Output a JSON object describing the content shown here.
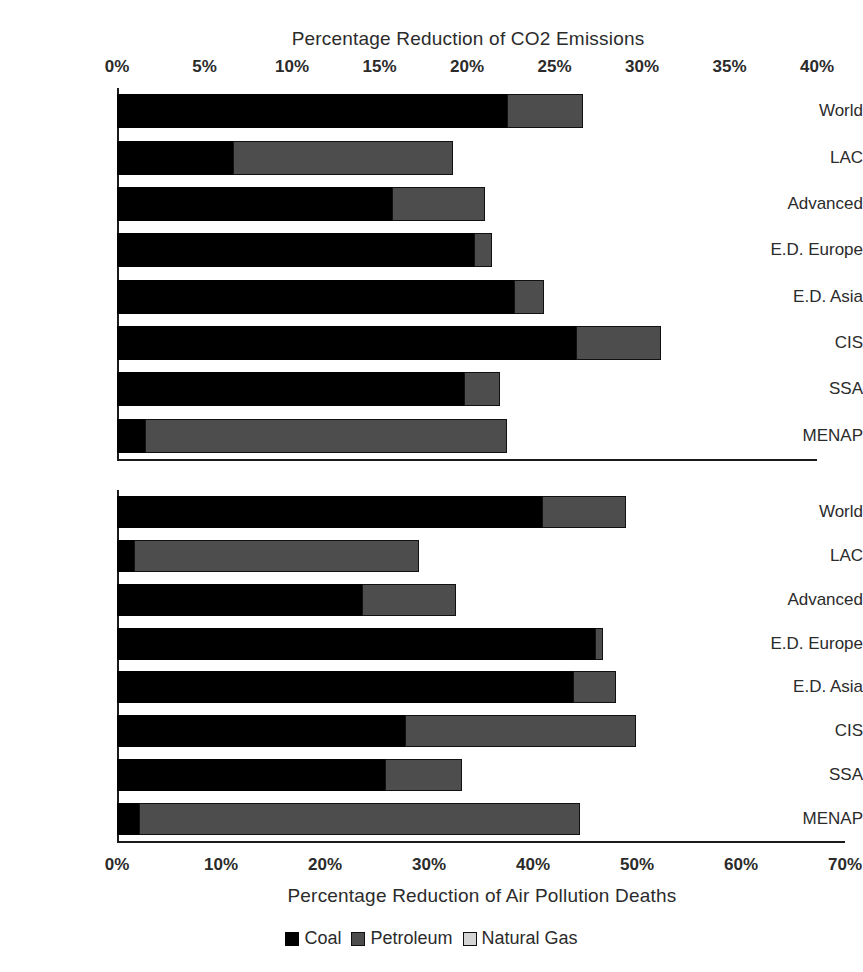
{
  "colors": {
    "coal": "#000000",
    "petroleum": "#4d4d4d",
    "natural_gas": "#d4d4d4",
    "text": "#2b2b2b",
    "background": "#ffffff"
  },
  "legend": {
    "position": "bottom-center",
    "items": [
      {
        "label": "Coal",
        "key": "coal"
      },
      {
        "label": "Petroleum",
        "key": "petroleum"
      },
      {
        "label": "Natural Gas",
        "key": "natural_gas"
      }
    ]
  },
  "chart_data": [
    {
      "id": "co2",
      "type": "bar",
      "orientation": "horizontal",
      "stacked": true,
      "title": "Percentage Reduction of CO2 Emissions",
      "title_position": "top",
      "xlabel": "",
      "ylabel": "",
      "xlim": [
        0,
        40
      ],
      "xticks": [
        0,
        5,
        10,
        15,
        20,
        25,
        30,
        35,
        40
      ],
      "xtick_labels": [
        "0%",
        "5%",
        "10%",
        "15%",
        "20%",
        "25%",
        "30%",
        "35%",
        "40%"
      ],
      "grid": false,
      "categories": [
        "World",
        "LAC",
        "Advanced",
        "E.D. Europe",
        "E.D. Asia",
        "CIS",
        "SSA",
        "MENAP"
      ],
      "series": [
        {
          "name": "Coal",
          "key": "coal",
          "values": [
            22.3,
            6.6,
            15.7,
            20.4,
            22.7,
            26.2,
            19.8,
            1.6
          ]
        },
        {
          "name": "Petroleum",
          "key": "petroleum",
          "values": [
            4.3,
            12.6,
            5.3,
            1.0,
            1.7,
            4.9,
            2.1,
            20.7
          ]
        },
        {
          "name": "Natural Gas",
          "key": "natural_gas",
          "values": [
            1.4,
            3.9,
            2.2,
            1.1,
            0.0,
            3.9,
            0.4,
            3.7
          ]
        }
      ],
      "totals": [
        28.0,
        23.1,
        23.2,
        22.5,
        24.4,
        35.0,
        22.3,
        26.0
      ]
    },
    {
      "id": "deaths",
      "type": "bar",
      "orientation": "horizontal",
      "stacked": true,
      "title": "Percentage Reduction of Air Pollution Deaths",
      "title_position": "bottom",
      "xlabel": "Percentage Reduction of Air Pollution Deaths",
      "ylabel": "",
      "xlim": [
        0,
        70
      ],
      "xticks": [
        0,
        10,
        20,
        30,
        40,
        50,
        60,
        70
      ],
      "xtick_labels": [
        "0%",
        "10%",
        "20%",
        "30%",
        "40%",
        "50%",
        "60%",
        "70%"
      ],
      "grid": false,
      "categories": [
        "World",
        "LAC",
        "Advanced",
        "E.D. Europe",
        "E.D. Asia",
        "CIS",
        "SSA",
        "MENAP"
      ],
      "series": [
        {
          "name": "Coal",
          "key": "coal",
          "values": [
            40.9,
            1.6,
            23.6,
            46.0,
            43.8,
            27.7,
            25.8,
            2.1
          ]
        },
        {
          "name": "Petroleum",
          "key": "petroleum",
          "values": [
            8.0,
            27.4,
            9.0,
            0.7,
            4.2,
            22.2,
            7.4,
            42.4
          ]
        },
        {
          "name": "Natural Gas",
          "key": "natural_gas",
          "values": [
            0.0,
            0.0,
            0.0,
            0.0,
            0.0,
            0.0,
            0.0,
            0.0
          ]
        }
      ],
      "totals": [
        48.9,
        29.0,
        32.6,
        46.7,
        48.0,
        49.9,
        33.2,
        44.5
      ]
    }
  ]
}
